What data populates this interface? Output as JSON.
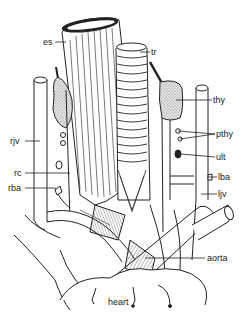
{
  "diagram": {
    "type": "anatomical illustration",
    "labels": [
      {
        "id": "es",
        "text": "es",
        "x": 43,
        "y": 37
      },
      {
        "id": "tr",
        "text": "tr",
        "x": 140,
        "y": 48
      },
      {
        "id": "thy",
        "text": "thy",
        "x": 213,
        "y": 97
      },
      {
        "id": "pthy",
        "text": "pthy",
        "x": 216,
        "y": 130
      },
      {
        "id": "ult",
        "text": "ult",
        "x": 216,
        "y": 154
      },
      {
        "id": "lba",
        "text": "lba",
        "x": 218,
        "y": 174
      },
      {
        "id": "ljv",
        "text": "ljv",
        "x": 218,
        "y": 191
      },
      {
        "id": "rjv",
        "text": "rjv",
        "x": 10,
        "y": 137
      },
      {
        "id": "rc",
        "text": "rc",
        "x": 14,
        "y": 169
      },
      {
        "id": "rba",
        "text": "rba",
        "x": 8,
        "y": 184
      },
      {
        "id": "aorta",
        "text": "aorta",
        "x": 207,
        "y": 255
      },
      {
        "id": "heart",
        "text": "heart",
        "x": 108,
        "y": 298
      }
    ],
    "colors": {
      "ink": "#222222",
      "background": "#ffffff",
      "stipple": "#9a9a9a"
    }
  }
}
